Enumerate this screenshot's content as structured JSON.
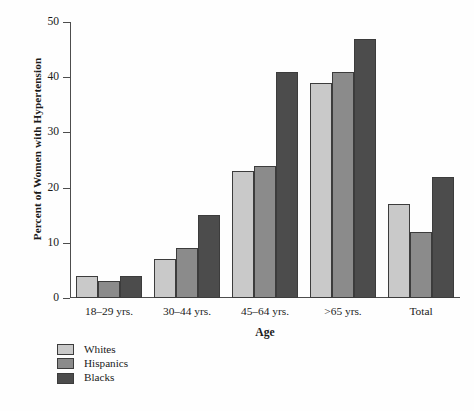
{
  "chart_data": {
    "type": "bar",
    "title": "",
    "xlabel": "Age",
    "ylabel": "Percent of Women with Hypertension",
    "categories": [
      "18–29 yrs.",
      "30–44 yrs.",
      "45–64 yrs.",
      ">65 yrs.",
      "Total"
    ],
    "series": [
      {
        "name": "Whites",
        "color": "#c9c9c9",
        "values": [
          4,
          7,
          23,
          39,
          17
        ]
      },
      {
        "name": "Hispanics",
        "color": "#8b8b8b",
        "values": [
          3,
          9,
          24,
          41,
          12
        ]
      },
      {
        "name": "Blacks",
        "color": "#4c4c4c",
        "values": [
          4,
          15,
          41,
          47,
          22
        ]
      }
    ],
    "ylim": [
      0,
      50
    ],
    "yticks": [
      0,
      10,
      20,
      30,
      40,
      50
    ],
    "ytick_labels": [
      "0",
      "10",
      "20",
      "30",
      "40",
      "50"
    ],
    "grid": false,
    "legend_position": "below-left"
  }
}
